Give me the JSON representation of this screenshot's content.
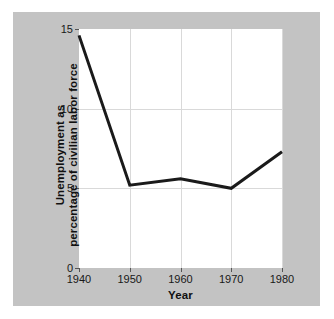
{
  "figure": {
    "background_color": "#ffffff",
    "panel_color": "#c3c3c3",
    "plot_background": "#ffffff",
    "line_color": "#1a1a1a",
    "grid_color": "#d9d9d9"
  },
  "chart_data": {
    "type": "line",
    "title": "",
    "xlabel": "Year",
    "ylabel": "Unemployment as percentage of civilian labor force",
    "ylabel_lines": [
      "Unemployment as",
      "percentage of civilian labor force"
    ],
    "x": [
      1940,
      1950,
      1960,
      1970,
      1980
    ],
    "values": [
      14.6,
      5.2,
      5.6,
      5.0,
      7.3
    ],
    "series": [
      {
        "name": "Unemployment rate",
        "values": [
          14.6,
          5.2,
          5.6,
          5.0,
          7.3
        ]
      }
    ],
    "xlim": [
      1940,
      1980
    ],
    "ylim": [
      0,
      15
    ],
    "xticks": [
      1940,
      1950,
      1960,
      1970,
      1980
    ],
    "xtick_labels": [
      "1940",
      "1950",
      "1960",
      "1970",
      "1980"
    ],
    "yticks": [
      0,
      5,
      10,
      15
    ],
    "ytick_labels": [
      "0",
      "5",
      "10",
      "15"
    ],
    "gridlines_x": [
      1950,
      1960,
      1970,
      1980
    ],
    "gridlines_y": [
      5,
      10
    ],
    "grid": true,
    "legend": false,
    "legend_position": "none",
    "markers": false,
    "line_width": 3
  }
}
